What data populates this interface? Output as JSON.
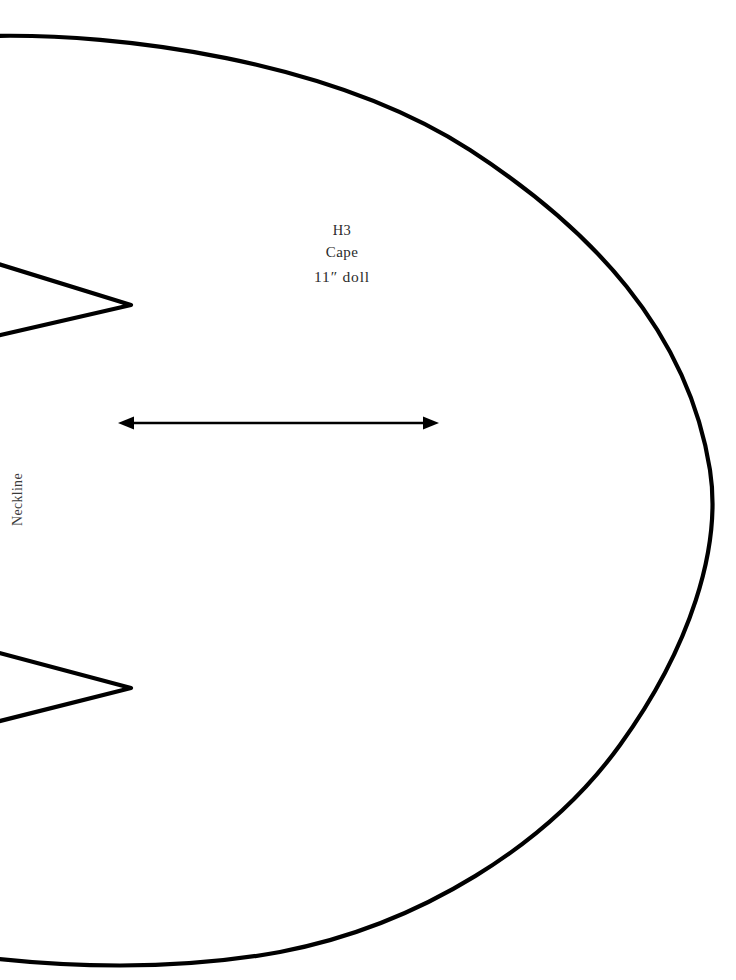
{
  "document": {
    "type": "sewing-pattern-sheet",
    "background_color": "#ffffff",
    "ink_color": "#000000",
    "width": 736,
    "height": 980
  },
  "pattern_piece": {
    "code": "H3",
    "name": "Cape",
    "size": "11″ doll",
    "edge_labels": {
      "neckline": "Neckline"
    }
  },
  "markings": {
    "grainline": {
      "name": "grainline-arrow",
      "style": "double-headed-arrow",
      "x_start": 119,
      "x_end": 438,
      "y": 423
    },
    "notches": [
      {
        "name": "upper-dart-notch",
        "apex_x": 130,
        "apex_y": 305,
        "top_y": 263,
        "bottom_y": 336
      },
      {
        "name": "lower-dart-notch",
        "apex_x": 130,
        "apex_y": 688,
        "top_y": 652,
        "bottom_y": 722
      }
    ]
  },
  "text_color": "#2b2b2b"
}
